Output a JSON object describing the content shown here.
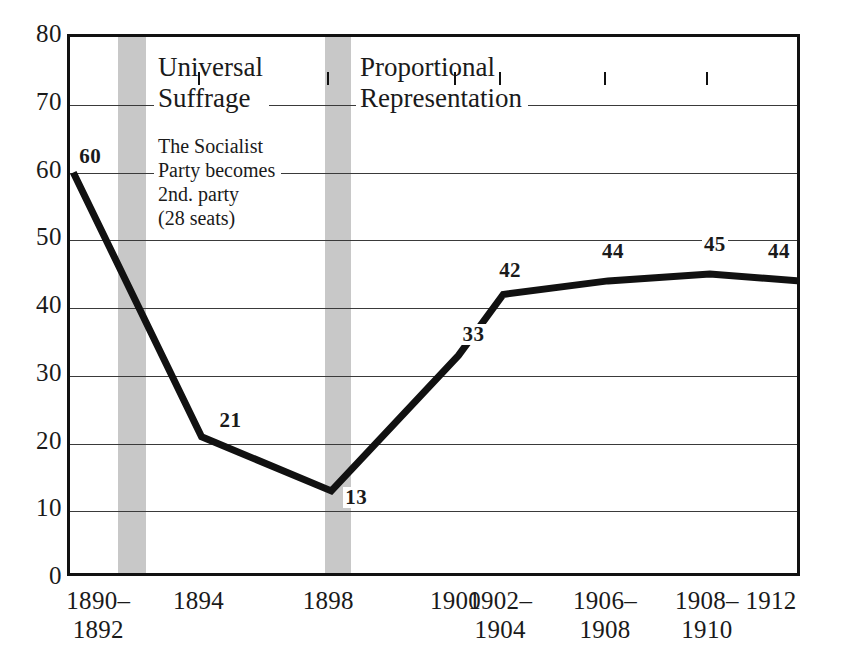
{
  "chart_data": {
    "type": "line",
    "title": "",
    "subtitle": "",
    "xlabel": "",
    "ylabel": "",
    "categories": [
      "1890–\n1892",
      "1894",
      "1898",
      "1900",
      "1902–\n1904",
      "1906–\n1908",
      "1908–\n1910",
      "1912"
    ],
    "x_tick_labels": [
      "1890–",
      "1894",
      "1898",
      "1900",
      "1902–",
      "1906–",
      "1908–",
      "1912"
    ],
    "x_tick_labels_line2": [
      "1892",
      "",
      "",
      "",
      "1904",
      "1908",
      "1910",
      ""
    ],
    "values": [
      60,
      21,
      13,
      33,
      42,
      44,
      45,
      44
    ],
    "point_labels": [
      "60",
      "21",
      "13",
      "33",
      "42",
      "44",
      "45",
      "44"
    ],
    "ylim": [
      0,
      80
    ],
    "y_ticks": [
      0,
      10,
      20,
      30,
      40,
      50,
      60,
      70,
      80
    ],
    "y_tick_labels": [
      "0",
      "10",
      "20",
      "30",
      "40",
      "50",
      "60",
      "70",
      "80"
    ],
    "grid": true,
    "gridlines_at": [
      10,
      20,
      30,
      40,
      50,
      60,
      70
    ],
    "legend": "none",
    "series": [
      {
        "name": "seats",
        "values": [
          60,
          21,
          13,
          33,
          42,
          44,
          45,
          44
        ],
        "color": "#111111"
      }
    ],
    "bands": [
      {
        "label": "Universal Suffrage",
        "x_start_frac": 0.0655,
        "x_end_frac": 0.1037,
        "color": "#b9b9b9"
      },
      {
        "label": "Proportional Representation",
        "x_start_frac": 0.3479,
        "x_end_frac": 0.3833,
        "color": "#b9b9b9"
      }
    ],
    "annotations": [
      {
        "text": "Universal\nSuffrage",
        "kind": "event-title"
      },
      {
        "text": "The Socialist\nParty becomes\n2nd. party\n(28 seats)",
        "kind": "event-body"
      },
      {
        "text": "Proportional\nRepresentation",
        "kind": "event-title"
      }
    ]
  },
  "annotations": {
    "universal_suffrage": "Universal\nSuffrage",
    "socialist_note": "The Socialist\nParty becomes\n2nd. party\n(28 seats)",
    "proportional_representation": "Proportional\nRepresentation"
  },
  "colors": {
    "line": "#111111",
    "band": "#b9b9b9",
    "axis": "#111111",
    "grid": "#3a3a3a",
    "background": "#ffffff",
    "text": "#1a1a1a"
  }
}
